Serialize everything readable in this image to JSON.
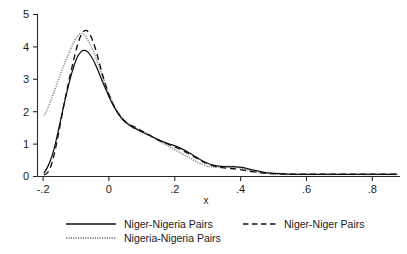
{
  "chart_data": {
    "type": "line",
    "title": "",
    "subtitle": "",
    "xlabel": "x",
    "ylabel": "",
    "xlim": [
      -0.22,
      0.88
    ],
    "ylim": [
      0,
      5.35
    ],
    "grid": false,
    "legend_position": "bottom",
    "xticks": [
      -0.2,
      0,
      0.2,
      0.4,
      0.6,
      0.8
    ],
    "xticklabels": [
      "-.2",
      "0",
      ".2",
      ".4",
      ".6",
      ".8"
    ],
    "yticks": [
      0,
      1,
      2,
      3,
      4,
      5
    ],
    "yticklabels": [
      "0",
      "1",
      "2",
      "3",
      "4",
      "5"
    ],
    "series": [
      {
        "name": "Niger-Nigeria Pairs",
        "style": "solid",
        "color": "#111111",
        "peak_x": -0.08,
        "peak_y": 4.15,
        "x": [
          -0.2,
          -0.19,
          -0.18,
          -0.17,
          -0.16,
          -0.15,
          -0.14,
          -0.13,
          -0.12,
          -0.11,
          -0.1,
          -0.09,
          -0.08,
          -0.07,
          -0.06,
          -0.05,
          -0.04,
          -0.03,
          -0.02,
          -0.01,
          0.0,
          0.01,
          0.02,
          0.03,
          0.04,
          0.05,
          0.06,
          0.07,
          0.08,
          0.09,
          0.1,
          0.12,
          0.14,
          0.16,
          0.18,
          0.2,
          0.22,
          0.24,
          0.26,
          0.28,
          0.3,
          0.32,
          0.34,
          0.36,
          0.38,
          0.4,
          0.42,
          0.44,
          0.46,
          0.48,
          0.5,
          0.54,
          0.58,
          0.62,
          0.66,
          0.7,
          0.74,
          0.78,
          0.82,
          0.87
        ],
        "y": [
          0.12,
          0.3,
          0.55,
          0.9,
          1.35,
          1.85,
          2.35,
          2.82,
          3.25,
          3.62,
          3.92,
          4.08,
          4.15,
          4.12,
          4.0,
          3.82,
          3.58,
          3.32,
          3.05,
          2.8,
          2.55,
          2.34,
          2.15,
          1.99,
          1.86,
          1.76,
          1.68,
          1.61,
          1.56,
          1.5,
          1.45,
          1.35,
          1.25,
          1.15,
          1.07,
          1.0,
          0.9,
          0.78,
          0.65,
          0.52,
          0.42,
          0.36,
          0.33,
          0.32,
          0.32,
          0.3,
          0.25,
          0.2,
          0.15,
          0.12,
          0.1,
          0.08,
          0.07,
          0.07,
          0.07,
          0.07,
          0.07,
          0.07,
          0.07,
          0.07
        ]
      },
      {
        "name": "Niger-Niger Pairs",
        "style": "dashed",
        "color": "#111111",
        "peak_x": -0.075,
        "peak_y": 4.8,
        "x": [
          -0.2,
          -0.19,
          -0.18,
          -0.17,
          -0.16,
          -0.15,
          -0.14,
          -0.13,
          -0.12,
          -0.11,
          -0.1,
          -0.09,
          -0.08,
          -0.07,
          -0.06,
          -0.05,
          -0.04,
          -0.03,
          -0.02,
          -0.01,
          0.0,
          0.01,
          0.02,
          0.03,
          0.04,
          0.05,
          0.06,
          0.07,
          0.08,
          0.09,
          0.1,
          0.12,
          0.14,
          0.16,
          0.18,
          0.2,
          0.22,
          0.24,
          0.26,
          0.28,
          0.3,
          0.32,
          0.34,
          0.36,
          0.38,
          0.4,
          0.42,
          0.44,
          0.46,
          0.48,
          0.5,
          0.54,
          0.58,
          0.62,
          0.66,
          0.7,
          0.74,
          0.78,
          0.82,
          0.87
        ],
        "y": [
          0.05,
          0.12,
          0.32,
          0.7,
          1.2,
          1.78,
          2.35,
          2.88,
          3.38,
          3.85,
          4.28,
          4.6,
          4.78,
          4.8,
          4.66,
          4.4,
          4.05,
          3.65,
          3.25,
          2.9,
          2.6,
          2.36,
          2.16,
          2.0,
          1.87,
          1.77,
          1.7,
          1.65,
          1.6,
          1.54,
          1.48,
          1.36,
          1.24,
          1.14,
          1.05,
          0.96,
          0.86,
          0.74,
          0.62,
          0.5,
          0.4,
          0.33,
          0.29,
          0.27,
          0.25,
          0.22,
          0.18,
          0.15,
          0.12,
          0.1,
          0.09,
          0.08,
          0.08,
          0.08,
          0.08,
          0.08,
          0.08,
          0.08,
          0.08,
          0.08
        ]
      },
      {
        "name": "Nigeria-Nigeria Pairs",
        "style": "dotted",
        "color": "#8e8e8e",
        "peak_x": -0.09,
        "peak_y": 4.7,
        "x": [
          -0.2,
          -0.19,
          -0.18,
          -0.17,
          -0.16,
          -0.15,
          -0.14,
          -0.13,
          -0.12,
          -0.11,
          -0.1,
          -0.09,
          -0.08,
          -0.07,
          -0.06,
          -0.05,
          -0.04,
          -0.03,
          -0.02,
          -0.01,
          0.0,
          0.01,
          0.02,
          0.03,
          0.04,
          0.05,
          0.06,
          0.07,
          0.08,
          0.09,
          0.1,
          0.12,
          0.14,
          0.16,
          0.18,
          0.2,
          0.22,
          0.24,
          0.26,
          0.28,
          0.3,
          0.32,
          0.34,
          0.36,
          0.38,
          0.4,
          0.42,
          0.44,
          0.46,
          0.48,
          0.5,
          0.54,
          0.58,
          0.62,
          0.66,
          0.7,
          0.74,
          0.78,
          0.82,
          0.87
        ],
        "y": [
          2.0,
          2.22,
          2.48,
          2.78,
          3.08,
          3.38,
          3.66,
          3.92,
          4.18,
          4.42,
          4.6,
          4.7,
          4.68,
          4.55,
          4.35,
          4.1,
          3.82,
          3.52,
          3.22,
          2.92,
          2.64,
          2.4,
          2.2,
          2.03,
          1.9,
          1.8,
          1.72,
          1.66,
          1.6,
          1.54,
          1.48,
          1.35,
          1.22,
          1.1,
          0.98,
          0.86,
          0.74,
          0.62,
          0.5,
          0.4,
          0.33,
          0.31,
          0.32,
          0.34,
          0.32,
          0.26,
          0.2,
          0.15,
          0.12,
          0.1,
          0.08,
          0.07,
          0.07,
          0.07,
          0.07,
          0.07,
          0.07,
          0.07,
          0.07,
          0.07
        ]
      }
    ]
  },
  "legend": {
    "entries": [
      {
        "label": "Niger-Nigeria Pairs",
        "style": "solid"
      },
      {
        "label": "Niger-Niger Pairs",
        "style": "dashed"
      },
      {
        "label": "Nigeria-Nigeria Pairs",
        "style": "dotted"
      }
    ]
  },
  "axes": {
    "x_title": "x"
  }
}
